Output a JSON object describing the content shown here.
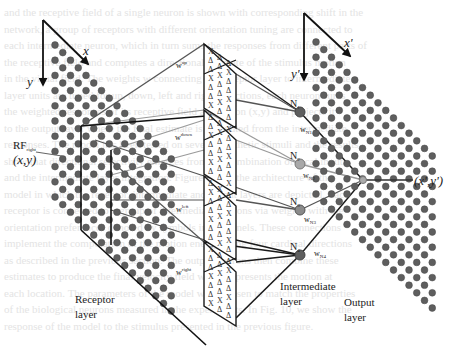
{
  "figure": {
    "type": "neural network architecture diagram",
    "colors": {
      "dot_fill": "#5e5e5e",
      "dot_stroke": "#4a4a4a",
      "line_dark": "#1a1a1a",
      "line_mid": "#555555",
      "line_light": "#9a9a9a",
      "node_light": "#a8a8a8",
      "background_text": "#e2e2e2"
    }
  },
  "receptor_layer": {
    "label_line1": "Receptor",
    "label_line2": "layer",
    "axis_x": "x",
    "axis_y": "y",
    "rf_label": "RF",
    "rf_subscript": "right",
    "rf_coords": "(x,y)"
  },
  "intermediate_layer": {
    "label_line1": "Intermediate",
    "label_line2": "layer",
    "weights": [
      {
        "name": "w",
        "superscript": "up"
      },
      {
        "name": "w",
        "superscript": "down"
      },
      {
        "name": "w",
        "superscript": "left"
      },
      {
        "name": "w",
        "superscript": "right"
      }
    ],
    "panel_symbols": [
      "Δ",
      "X"
    ],
    "nodes": [
      {
        "label": "N",
        "subscript": "1"
      },
      {
        "label": "N",
        "subscript": "2"
      },
      {
        "label": "N",
        "subscript": "3"
      },
      {
        "label": "N",
        "subscript": "4"
      }
    ]
  },
  "output_layer": {
    "label_line1": "Output",
    "label_line2": "layer",
    "axis_x": "x'",
    "axis_y": "y'",
    "output_weights": [
      {
        "name": "w",
        "subscript": "N1"
      },
      {
        "name": "w",
        "subscript": "N2"
      },
      {
        "name": "w",
        "subscript": "N3"
      },
      {
        "name": "w",
        "subscript": "N4"
      }
    ],
    "output_coords": "(x',y')"
  },
  "background_text_lines": [
    "and the receptive field of a single neuron is shown with corresponding shift in the",
    "network, a group of receptors with different orientation tuning are connected to",
    "each intermediate neuron, which in turn sums the responses from different parts of",
    "the receptive field and computes a directional estimate of the stimulus motion",
    "in the visual field. The weights w connecting the receptor layer to intermediate",
    "layer units are tuned for up, down, left and right directions, each neuron sums",
    "the weighted responses of its receptive field at location (x,y) and projects it",
    "to the output layer where the final estimate is computed from the intermediate",
    "responses. The model has been tested on several synthetic stimuli and the results",
    "show that directional selectivity emerges from the combination of local inputs",
    "and the intermediate layer integration. Figure shows the architecture of the",
    "model in which the receptor, intermediate and output layers are depicted. Each",
    "receptor is connected to a group of intermediate neurons via weights with the",
    "orientation preferences denoted by symbols in the panels. These connections",
    "implement the computation of the motion energy along four cardinal directions",
    "as described in the previous section. The output neurons then combine these",
    "estimates to produce the final velocity field which represents the motion at",
    "each location. The parameters of the model were chosen to match the properties",
    "of the biological neurons measured in the experiments. In Fig. 10, we show the",
    "response of the model to the stimulus presented in the previous figure."
  ]
}
